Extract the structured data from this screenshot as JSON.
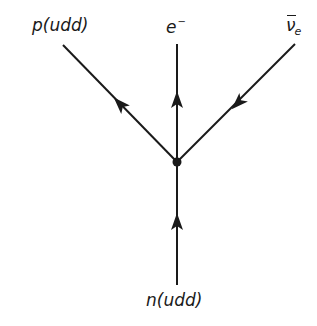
{
  "diagram": {
    "type": "feynman-diagram",
    "vertex": {
      "x": 177,
      "y": 162
    },
    "line_color": "#1a1a1a",
    "particles": {
      "incoming": {
        "label": "n(udd)",
        "symbol": "n",
        "quarks": "udd",
        "direction": "into vertex",
        "line": {
          "x1": 177,
          "y1": 285,
          "x2": 177,
          "y2": 162
        },
        "arrow": {
          "x": 177,
          "y": 222,
          "angle_deg": -90
        }
      },
      "outgoing_left": {
        "label": "p(udd)",
        "symbol": "p",
        "quarks": "udd",
        "direction": "away from vertex",
        "line": {
          "x1": 177,
          "y1": 162,
          "x2": 63,
          "y2": 45
        },
        "arrow": {
          "x": 120,
          "y": 100,
          "angle_deg": -134
        }
      },
      "outgoing_middle": {
        "label_base": "e",
        "label_sup": "−",
        "label": "e−",
        "direction": "away from vertex",
        "line": {
          "x1": 177,
          "y1": 162,
          "x2": 177,
          "y2": 44
        },
        "arrow": {
          "x": 177,
          "y": 100,
          "angle_deg": -90
        }
      },
      "antineutrino": {
        "label_base": "ν",
        "label_sub": "e",
        "label": "ν̄e",
        "overbar": true,
        "direction": "arrow toward vertex",
        "line": {
          "x1": 295,
          "y1": 44,
          "x2": 177,
          "y2": 162
        },
        "arrow": {
          "x": 240,
          "y": 101,
          "angle_deg": 135
        }
      }
    }
  }
}
